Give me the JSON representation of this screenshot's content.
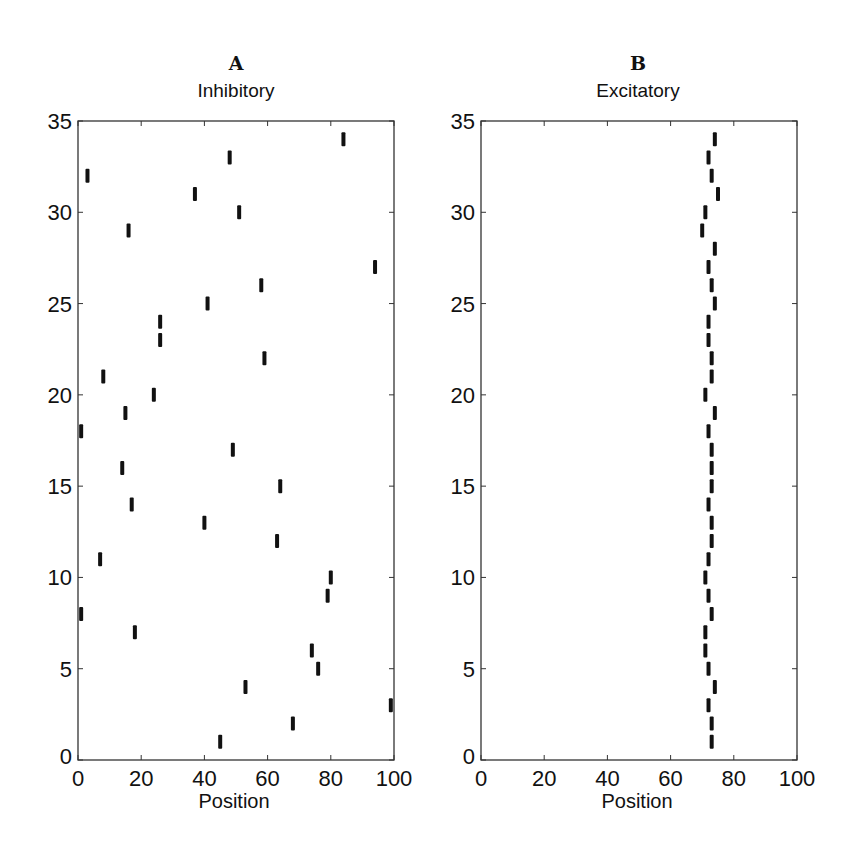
{
  "chart_data": [
    {
      "type": "scatter",
      "marker": "vertical-tick",
      "panel_letter": "A",
      "title": "Inhibitory",
      "xlabel": "Position",
      "ylabel": "",
      "xlim": [
        0,
        100
      ],
      "ylim": [
        0,
        35
      ],
      "xticks": [
        0,
        20,
        40,
        60,
        80,
        100
      ],
      "yticks": [
        0,
        5,
        10,
        15,
        20,
        25,
        30,
        35
      ],
      "grid": false,
      "legend": null,
      "points": [
        {
          "y": 1,
          "x": 45
        },
        {
          "y": 2,
          "x": 68
        },
        {
          "y": 3,
          "x": 99
        },
        {
          "y": 4,
          "x": 53
        },
        {
          "y": 5,
          "x": 76
        },
        {
          "y": 6,
          "x": 74
        },
        {
          "y": 7,
          "x": 18
        },
        {
          "y": 8,
          "x": 1
        },
        {
          "y": 9,
          "x": 79
        },
        {
          "y": 10,
          "x": 80
        },
        {
          "y": 11,
          "x": 7
        },
        {
          "y": 12,
          "x": 63
        },
        {
          "y": 13,
          "x": 40
        },
        {
          "y": 14,
          "x": 17
        },
        {
          "y": 15,
          "x": 64
        },
        {
          "y": 16,
          "x": 14
        },
        {
          "y": 17,
          "x": 49
        },
        {
          "y": 18,
          "x": 1
        },
        {
          "y": 19,
          "x": 15
        },
        {
          "y": 20,
          "x": 24
        },
        {
          "y": 21,
          "x": 8
        },
        {
          "y": 22,
          "x": 59
        },
        {
          "y": 23,
          "x": 26
        },
        {
          "y": 24,
          "x": 26
        },
        {
          "y": 25,
          "x": 41
        },
        {
          "y": 26,
          "x": 58
        },
        {
          "y": 27,
          "x": 94
        },
        {
          "y": 29,
          "x": 16
        },
        {
          "y": 30,
          "x": 51
        },
        {
          "y": 31,
          "x": 37
        },
        {
          "y": 32,
          "x": 3
        },
        {
          "y": 33,
          "x": 48
        },
        {
          "y": 34,
          "x": 84
        }
      ]
    },
    {
      "type": "scatter",
      "marker": "vertical-tick",
      "panel_letter": "B",
      "title": "Excitatory",
      "xlabel": "Position",
      "ylabel": "",
      "xlim": [
        0,
        100
      ],
      "ylim": [
        0,
        35
      ],
      "xticks": [
        0,
        20,
        40,
        60,
        80,
        100
      ],
      "yticks": [
        0,
        5,
        10,
        15,
        20,
        25,
        30,
        35
      ],
      "grid": false,
      "legend": null,
      "points": [
        {
          "y": 1,
          "x": 73
        },
        {
          "y": 2,
          "x": 73
        },
        {
          "y": 3,
          "x": 72
        },
        {
          "y": 4,
          "x": 74
        },
        {
          "y": 5,
          "x": 72
        },
        {
          "y": 6,
          "x": 71
        },
        {
          "y": 7,
          "x": 71
        },
        {
          "y": 8,
          "x": 73
        },
        {
          "y": 9,
          "x": 72
        },
        {
          "y": 10,
          "x": 71
        },
        {
          "y": 11,
          "x": 72
        },
        {
          "y": 12,
          "x": 73
        },
        {
          "y": 13,
          "x": 73
        },
        {
          "y": 14,
          "x": 72
        },
        {
          "y": 15,
          "x": 73
        },
        {
          "y": 16,
          "x": 73
        },
        {
          "y": 17,
          "x": 73
        },
        {
          "y": 18,
          "x": 72
        },
        {
          "y": 19,
          "x": 74
        },
        {
          "y": 20,
          "x": 71
        },
        {
          "y": 21,
          "x": 73
        },
        {
          "y": 22,
          "x": 73
        },
        {
          "y": 23,
          "x": 72
        },
        {
          "y": 24,
          "x": 72
        },
        {
          "y": 25,
          "x": 74
        },
        {
          "y": 26,
          "x": 73
        },
        {
          "y": 27,
          "x": 72
        },
        {
          "y": 28,
          "x": 74
        },
        {
          "y": 29,
          "x": 70
        },
        {
          "y": 30,
          "x": 71
        },
        {
          "y": 31,
          "x": 75
        },
        {
          "y": 32,
          "x": 73
        },
        {
          "y": 33,
          "x": 72
        },
        {
          "y": 34,
          "x": 74
        }
      ]
    }
  ],
  "colors": {
    "marker": "#111111",
    "axis": "#333333",
    "background": "#ffffff"
  }
}
